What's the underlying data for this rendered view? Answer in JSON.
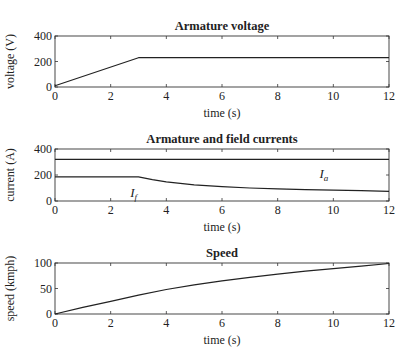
{
  "chart_data": [
    {
      "type": "line",
      "title": "Armature voltage",
      "xlabel": "time (s)",
      "ylabel": "voltage (V)",
      "xlim": [
        0,
        12
      ],
      "ylim": [
        0,
        400
      ],
      "xticks": [
        0,
        2,
        4,
        6,
        8,
        10,
        12
      ],
      "yticks": [
        0,
        200,
        400
      ],
      "grid": false,
      "series": [
        {
          "name": "Va",
          "x": [
            0,
            3,
            12
          ],
          "y": [
            10,
            230,
            230
          ]
        }
      ],
      "annotations": []
    },
    {
      "type": "line",
      "title": "Armature and field currents",
      "xlabel": "time (s)",
      "ylabel": "current (A)",
      "xlim": [
        0,
        12
      ],
      "ylim": [
        0,
        400
      ],
      "xticks": [
        0,
        2,
        4,
        6,
        8,
        10,
        12
      ],
      "yticks": [
        0,
        200,
        400
      ],
      "grid": false,
      "series": [
        {
          "name": "Ia",
          "x": [
            0,
            12
          ],
          "y": [
            320,
            320
          ]
        },
        {
          "name": "If",
          "x": [
            0,
            3,
            3.5,
            4,
            5,
            6,
            7,
            8,
            9,
            10,
            11,
            12
          ],
          "y": [
            185,
            185,
            165,
            148,
            125,
            110,
            100,
            93,
            88,
            83,
            79,
            75
          ]
        }
      ],
      "annotations": [
        {
          "text": "I",
          "sub": "a",
          "x": 9.5,
          "y": 175
        },
        {
          "text": "I",
          "sub": "f",
          "x": 2.7,
          "y": 30
        }
      ]
    },
    {
      "type": "line",
      "title": "Speed",
      "xlabel": "time (s)",
      "ylabel": "speed (kmph)",
      "xlim": [
        0,
        12
      ],
      "ylim": [
        0,
        100
      ],
      "xticks": [
        0,
        2,
        4,
        6,
        8,
        10,
        12
      ],
      "yticks": [
        0,
        50,
        100
      ],
      "grid": false,
      "series": [
        {
          "name": "speed",
          "x": [
            0,
            1,
            2,
            3,
            4,
            5,
            6,
            7,
            8,
            9,
            10,
            11,
            12
          ],
          "y": [
            0,
            13,
            25,
            37,
            48,
            57,
            65,
            72,
            78,
            84,
            89,
            94,
            99
          ]
        }
      ],
      "annotations": []
    }
  ],
  "layout": {
    "plot_left": 55,
    "plot_right": 389,
    "panels": [
      {
        "top": 36,
        "bottom": 87
      },
      {
        "top": 149,
        "bottom": 201
      },
      {
        "top": 263,
        "bottom": 314
      }
    ],
    "line_color": "#222222",
    "axis_color": "#333333"
  }
}
